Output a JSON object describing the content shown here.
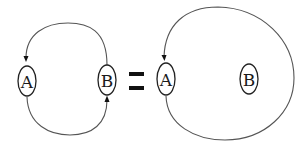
{
  "diagram": {
    "type": "graph-equivalence",
    "colors": {
      "edge": "#555555",
      "node_stroke": "#222222",
      "label": "#1a1a1a",
      "equals": "#111111",
      "background": "#ffffff"
    },
    "left_graph": {
      "nodes": [
        {
          "id": "A",
          "label": "A"
        },
        {
          "id": "B",
          "label": "B"
        }
      ],
      "edges": [
        {
          "from": "B",
          "to": "A",
          "route": "top-arc",
          "arrow_at": "A"
        },
        {
          "from": "A",
          "to": "B",
          "route": "bottom-arc",
          "arrow_at": "B"
        }
      ]
    },
    "relation": {
      "symbol": "=",
      "meaning": "equals"
    },
    "right_graph": {
      "nodes": [
        {
          "id": "A",
          "label": "A"
        },
        {
          "id": "B",
          "label": "B"
        }
      ],
      "edges": [
        {
          "from": "A",
          "to": "A",
          "route": "large-loop-around-B",
          "arrow_at": "A"
        }
      ]
    }
  }
}
